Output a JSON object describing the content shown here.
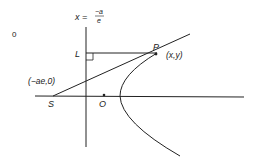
{
  "diagram": {
    "directrix_label": {
      "lhs": "x =",
      "numerator": "−a",
      "denominator": "e"
    },
    "corner_label": "0",
    "labels": {
      "L": "L",
      "P": "P",
      "P_coords": "(x,y)",
      "S_coords": "(−ae,0)",
      "S": "S",
      "O": "O"
    },
    "colors": {
      "stroke": "#222222",
      "background": "#ffffff"
    }
  }
}
